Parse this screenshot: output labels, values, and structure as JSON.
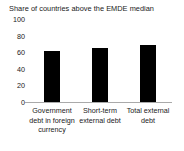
{
  "chart_data": {
    "type": "bar",
    "title": "Share of countries above the EMDE median",
    "subtitle": "",
    "xlabel": "",
    "ylabel": "",
    "ylim": [
      0,
      100
    ],
    "yticks": [
      0,
      20,
      40,
      60,
      80,
      100
    ],
    "ytick_labels": [
      "0",
      "20",
      "40",
      "60",
      "80",
      "100"
    ],
    "grid": false,
    "legend": false,
    "legend_position": "none",
    "bar_color": "#000000",
    "axis_color": "#aaaaaa",
    "categories": [
      "Government debt in foreign currency",
      "Short-term external debt",
      "Total external debt"
    ],
    "category_lines": [
      [
        "Government",
        "debt in foreign",
        "currency"
      ],
      [
        "Short-term",
        "external debt"
      ],
      [
        "Total external",
        "debt"
      ]
    ],
    "values": [
      63,
      66,
      70
    ],
    "series": [
      {
        "name": "Share of countries above the EMDE median",
        "values": [
          63,
          66,
          70
        ]
      }
    ]
  }
}
